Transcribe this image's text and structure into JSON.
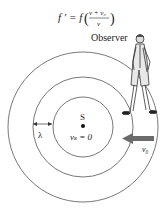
{
  "formula": {
    "lhs": "f ′ = f",
    "numerator": "v + v₀",
    "denominator": "v"
  },
  "labels": {
    "observer": "Observer",
    "source": "S",
    "source_velocity": "vₛ = 0",
    "wavelength": "λ",
    "observer_velocity": "v₀"
  },
  "colors": {
    "circle": "#555555",
    "arrow": "#6b6b6b",
    "text": "#222222"
  }
}
